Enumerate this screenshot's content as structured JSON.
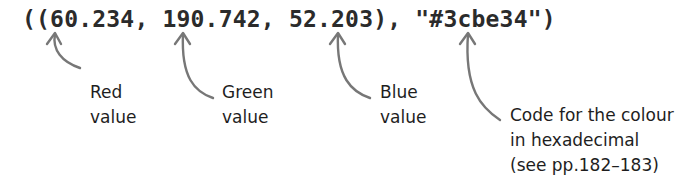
{
  "code": {
    "text": "((60.234, 190.742, 52.203), \"#3cbe34\")",
    "red": "60.234",
    "green": "190.742",
    "blue": "52.203",
    "hex": "#3cbe34"
  },
  "annotations": [
    {
      "id": "red",
      "line1": "Red",
      "line2": "value",
      "line3": ""
    },
    {
      "id": "green",
      "line1": "Green",
      "line2": "value",
      "line3": ""
    },
    {
      "id": "blue",
      "line1": "Blue",
      "line2": "value",
      "line3": ""
    },
    {
      "id": "hex",
      "line1": "Code for the colour",
      "line2": "in hexadecimal",
      "line3": "(see pp.182–183)"
    }
  ],
  "colors": {
    "text": "#1e1e1e",
    "code": "#2b2b2b",
    "arrow": "#777777",
    "background": "#ffffff"
  }
}
